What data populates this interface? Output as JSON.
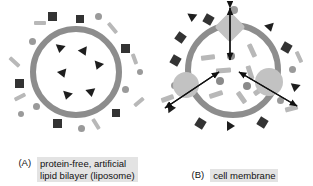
{
  "figure": {
    "background": "#ffffff",
    "membrane_color": "#8d8d8d",
    "protein_color": "#c2c2c2",
    "particle_dark": "#333333",
    "particle_mid": "#9a9a9a",
    "particle_light": "#b8b8b8",
    "caption_band_color": "#e3e3e3"
  },
  "panels": [
    {
      "letter": "(A)",
      "caption_line1": "protein-free, artificial",
      "caption_line2": "lipid bilayer (liposome)",
      "structure_name": "liposome",
      "interior_triangles": 6,
      "has_proteins": false,
      "arrows": 0
    },
    {
      "letter": "(B)",
      "caption_line1": "cell membrane",
      "caption_line2": "",
      "structure_name": "cell membrane",
      "interior_triangles": 0,
      "has_proteins": true,
      "proteins": [
        "channel-protein-top",
        "transport-protein-left",
        "transport-protein-right"
      ],
      "arrows": 3
    }
  ]
}
